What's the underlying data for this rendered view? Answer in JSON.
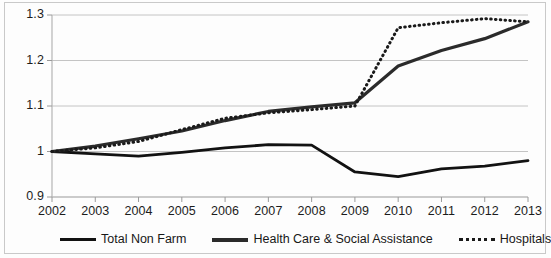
{
  "chart_data": {
    "type": "line",
    "title": "",
    "xlabel": "",
    "ylabel": "",
    "x": [
      2002,
      2003,
      2004,
      2005,
      2006,
      2007,
      2008,
      2009,
      2010,
      2011,
      2012,
      2013
    ],
    "categories": [
      "2002",
      "2003",
      "2004",
      "2005",
      "2006",
      "2007",
      "2008",
      "2009",
      "2010",
      "2011",
      "2012",
      "2013"
    ],
    "xlim": [
      2002,
      2013
    ],
    "ylim": [
      0.9,
      1.3
    ],
    "yticks": [
      0.9,
      1.0,
      1.1,
      1.2,
      1.3
    ],
    "ytick_labels": [
      "0.9",
      "1",
      "1.1",
      "1.2",
      "1.3"
    ],
    "grid": "horizontal",
    "legend_position": "bottom",
    "series": [
      {
        "name": "Total Non Farm",
        "style": "solid",
        "color": "#121212",
        "values": [
          1.0,
          0.995,
          0.99,
          0.998,
          1.008,
          1.015,
          1.014,
          0.955,
          0.945,
          0.962,
          0.968,
          0.98
        ]
      },
      {
        "name": "Health Care & Social Assistance",
        "style": "solid",
        "color": "#2b2b2b",
        "values": [
          1.0,
          1.012,
          1.028,
          1.045,
          1.068,
          1.088,
          1.098,
          1.107,
          1.188,
          1.222,
          1.248,
          1.285
        ]
      },
      {
        "name": "Hospitals",
        "style": "dotted",
        "color": "#1a1a1a",
        "values": [
          1.0,
          1.008,
          1.022,
          1.048,
          1.073,
          1.085,
          1.092,
          1.1,
          1.272,
          1.283,
          1.292,
          1.285
        ]
      }
    ]
  },
  "axes": {
    "y_labels": [
      "1.3",
      "1.2",
      "1.1",
      "1",
      "0.9"
    ],
    "x_labels": [
      "2002",
      "2003",
      "2004",
      "2005",
      "2006",
      "2007",
      "2008",
      "2009",
      "2010",
      "2011",
      "2012",
      "2013"
    ]
  },
  "legend": {
    "items": [
      {
        "label": "Total Non Farm",
        "swatch": "solid-thin-line-icon"
      },
      {
        "label": "Health Care & Social Assistance",
        "swatch": "solid-thick-line-icon"
      },
      {
        "label": "Hospitals",
        "swatch": "dotted-line-icon"
      }
    ]
  }
}
